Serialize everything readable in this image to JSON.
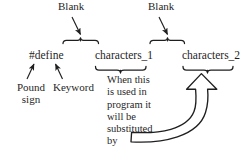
{
  "diagram": {
    "ink_color": "#1f1f1f",
    "labels": {
      "blank_left": "Blank",
      "blank_right": "Blank",
      "directive": "#define",
      "operand_1": "characters_1",
      "operand_2": "characters_2",
      "pound_sign": "Pound\nsign",
      "keyword": "Keyword"
    },
    "body_text": {
      "lines": [
        "When this",
        "is used in",
        "program it",
        "will be",
        "substituted",
        "by"
      ],
      "full": "When this is used in program it will be substituted by"
    },
    "connectors": [
      {
        "name": "blank-left-arrow",
        "from": "Blank",
        "to": "space between #define and characters_1"
      },
      {
        "name": "blank-right-arrow",
        "from": "Blank",
        "to": "space between characters_1 and characters_2"
      },
      {
        "name": "pound-sign-arrow",
        "from": "Pound sign",
        "to": "# of #define"
      },
      {
        "name": "keyword-arrow",
        "from": "Keyword",
        "to": "define of #define"
      },
      {
        "name": "substitution-block-arrow",
        "from": "by",
        "to": "characters_2"
      }
    ],
    "braces": [
      {
        "name": "brace-blank-left",
        "over": "Blank"
      },
      {
        "name": "brace-blank-right",
        "over": "Blank"
      },
      {
        "name": "brace-characters-1",
        "under": "characters_1"
      },
      {
        "name": "brace-characters-2",
        "under": "characters_2"
      }
    ]
  }
}
